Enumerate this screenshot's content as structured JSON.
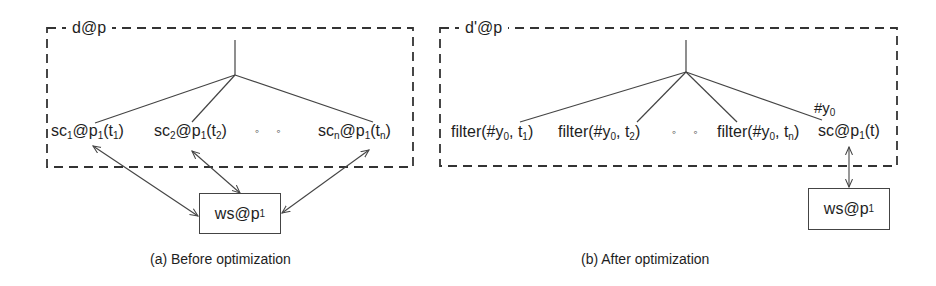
{
  "panels": [
    {
      "id": "before",
      "container_label": "d@p",
      "nodes": [
        {
          "base": "sc",
          "sub": "1",
          "mid": "@p",
          "sub2": "1",
          "arg": "t",
          "argsub": "1"
        },
        {
          "base": "sc",
          "sub": "2",
          "mid": "@p",
          "sub2": "1",
          "arg": "t",
          "argsub": "2"
        },
        {
          "base": "sc",
          "sub": "n",
          "mid": "@p",
          "sub2": "1",
          "arg": "t",
          "argsub": "n"
        }
      ],
      "ellipsis": "◦ ◦",
      "service_box": {
        "base": "ws@p",
        "sub": "1"
      },
      "caption": "(a) Before optimization"
    },
    {
      "id": "after",
      "container_label": "d'@p",
      "nodes": [
        {
          "text": "filter(#y",
          "sub": "0",
          "rest": ", t",
          "argsub": "1"
        },
        {
          "text": "filter(#y",
          "sub": "0",
          "rest": ", t",
          "argsub": "2"
        },
        {
          "text": "filter(#y",
          "sub": "0",
          "rest": ", t",
          "argsub": "n"
        },
        {
          "base": "sc@p",
          "sub": "1",
          "arg": "(t)"
        }
      ],
      "edge_label": {
        "base": "#y",
        "sub": "0"
      },
      "ellipsis": "◦ ◦",
      "service_box": {
        "base": "ws@p",
        "sub": "1"
      },
      "caption": "(b) After optimization"
    }
  ],
  "colors": {
    "line": "#444444",
    "text": "#1e1e1e",
    "background": "#ffffff"
  }
}
